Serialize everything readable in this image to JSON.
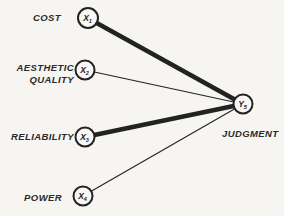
{
  "figure": {
    "background": "#f6f5f2",
    "ink": "#222222",
    "nodes": [
      {
        "id": "x1",
        "var": "X",
        "sub": "1",
        "x": 88,
        "y": 18,
        "r": 10
      },
      {
        "id": "x2",
        "var": "X",
        "sub": "2",
        "x": 85,
        "y": 70,
        "r": 9.5
      },
      {
        "id": "x3",
        "var": "X",
        "sub": "3",
        "x": 85,
        "y": 137,
        "r": 9.5
      },
      {
        "id": "x4",
        "var": "X",
        "sub": "4",
        "x": 83,
        "y": 196,
        "r": 9.5
      },
      {
        "id": "y5",
        "var": "Y",
        "sub": "5",
        "x": 243,
        "y": 104,
        "r": 9.5
      }
    ],
    "edges": [
      {
        "from": "x1",
        "to": "y5",
        "strength": "strong",
        "width": 4.6
      },
      {
        "from": "x2",
        "to": "y5",
        "strength": "weak",
        "width": 1.1
      },
      {
        "from": "x3",
        "to": "y5",
        "strength": "strong",
        "width": 4.6
      },
      {
        "from": "x4",
        "to": "y5",
        "strength": "weak",
        "width": 1.1
      }
    ],
    "labels": [
      {
        "for": "x1",
        "lines": [
          "COST"
        ],
        "x": 61,
        "y": 21,
        "anchor": "end",
        "line_height": 12
      },
      {
        "for": "x2",
        "lines": [
          "AESTHETIC",
          "QUALITY"
        ],
        "x": 74,
        "y": 71,
        "anchor": "end",
        "line_height": 12
      },
      {
        "for": "x3",
        "lines": [
          "RELIABILITY"
        ],
        "x": 74,
        "y": 140,
        "anchor": "end",
        "line_height": 12
      },
      {
        "for": "x4",
        "lines": [
          "POWER"
        ],
        "x": 62,
        "y": 201,
        "anchor": "end",
        "line_height": 12
      },
      {
        "for": "y5",
        "lines": [
          "JUDGMENT"
        ],
        "x": 222,
        "y": 137,
        "anchor": "start",
        "line_height": 12
      }
    ]
  }
}
